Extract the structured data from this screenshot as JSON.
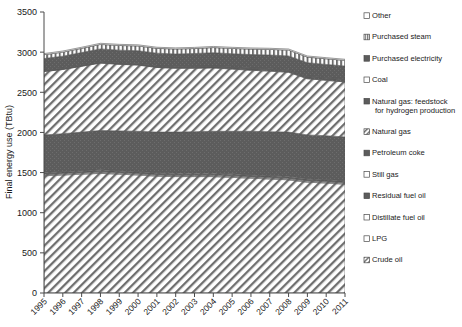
{
  "chart_data": {
    "type": "area",
    "title": "",
    "subtitle": "",
    "xlabel": "",
    "ylabel": "Final energy use (TBtu)",
    "xlim": [
      1995,
      2011
    ],
    "ylim": [
      0,
      3500
    ],
    "yticks": [
      0,
      500,
      1000,
      1500,
      2000,
      2500,
      3000,
      3500
    ],
    "grid": false,
    "stacked": true,
    "legend_position": "right",
    "categories": [
      "1995",
      "1996",
      "1997",
      "1998",
      "1999",
      "2000",
      "2001",
      "2002",
      "2003",
      "2004",
      "2005",
      "2006",
      "2007",
      "2008",
      "2009",
      "2010",
      "2011"
    ],
    "series": [
      {
        "name": "Crude oil",
        "pattern": "diagonal-hatch-light",
        "values": [
          1460,
          1470,
          1480,
          1490,
          1480,
          1470,
          1455,
          1450,
          1450,
          1450,
          1440,
          1430,
          1420,
          1410,
          1380,
          1370,
          1355
        ]
      },
      {
        "name": "LPG",
        "pattern": "diagonal-hatch-light",
        "values": [
          12,
          12,
          12,
          12,
          12,
          12,
          12,
          12,
          12,
          12,
          12,
          12,
          12,
          12,
          12,
          12,
          12
        ]
      },
      {
        "name": "Distillate fuel oil",
        "pattern": "diagonal-hatch-light",
        "values": [
          10,
          10,
          10,
          10,
          10,
          10,
          10,
          10,
          10,
          10,
          10,
          10,
          10,
          10,
          10,
          10,
          10
        ]
      },
      {
        "name": "Residual fuel oil",
        "pattern": "solid-dark",
        "values": [
          14,
          14,
          14,
          14,
          14,
          14,
          14,
          14,
          14,
          14,
          14,
          14,
          14,
          14,
          14,
          14,
          14
        ]
      },
      {
        "name": "Still gas",
        "pattern": "diagonal-hatch-light",
        "values": [
          8,
          8,
          8,
          8,
          8,
          8,
          8,
          8,
          8,
          8,
          8,
          8,
          8,
          8,
          8,
          8,
          8
        ]
      },
      {
        "name": "Petroleum coke",
        "pattern": "solid-dark",
        "values": [
          465,
          470,
          480,
          490,
          495,
          500,
          505,
          510,
          515,
          520,
          530,
          540,
          545,
          550,
          545,
          545,
          545
        ]
      },
      {
        "name": "Natural gas",
        "pattern": "diagonal-hatch-light",
        "values": [
          790,
          800,
          820,
          840,
          830,
          825,
          805,
          795,
          790,
          790,
          775,
          760,
          755,
          745,
          700,
          690,
          685
        ]
      },
      {
        "name": "Natural gas: feedstock for hydrogen production",
        "pattern": "solid-dark",
        "values": [
          6,
          6,
          6,
          6,
          6,
          6,
          8,
          10,
          12,
          14,
          16,
          18,
          20,
          22,
          24,
          26,
          28
        ]
      },
      {
        "name": "Coal",
        "pattern": "solid-dark-thin",
        "values": [
          10,
          10,
          10,
          10,
          10,
          10,
          10,
          10,
          10,
          10,
          10,
          10,
          10,
          10,
          10,
          10,
          10
        ]
      },
      {
        "name": "Purchased electricity",
        "pattern": "solid-dark",
        "values": [
          145,
          150,
          155,
          160,
          160,
          162,
          160,
          158,
          162,
          165,
          165,
          168,
          170,
          172,
          165,
          162,
          160
        ]
      },
      {
        "name": "Purchased steam",
        "pattern": "vertical-stripes",
        "values": [
          48,
          50,
          52,
          56,
          58,
          60,
          60,
          62,
          62,
          64,
          66,
          68,
          70,
          72,
          70,
          70,
          70
        ]
      },
      {
        "name": "Other",
        "pattern": "white-outline",
        "values": [
          14,
          14,
          14,
          14,
          14,
          14,
          14,
          14,
          14,
          14,
          14,
          14,
          14,
          14,
          14,
          14,
          14
        ]
      }
    ],
    "totals": [
      2982,
      3004,
      3041,
      3090,
      3087,
      3091,
      3061,
      3053,
      3059,
      3071,
      3062,
      3048,
      3044,
      3041,
      2952,
      2931,
      2911
    ]
  },
  "legend": {
    "items": [
      {
        "label": "Other",
        "pattern": "white-outline"
      },
      {
        "label": "Purchased steam",
        "pattern": "vertical-stripes"
      },
      {
        "label": "Purchased electricity",
        "pattern": "solid-dark"
      },
      {
        "label": "Coal",
        "pattern": "white-outline"
      },
      {
        "label": "Natural gas: feedstock",
        "label2": "for hydrogen production",
        "pattern": "solid-dark"
      },
      {
        "label": "Natural gas",
        "pattern": "diagonal-hatch-light"
      },
      {
        "label": "Petroleum coke",
        "pattern": "solid-dark"
      },
      {
        "label": "Still gas",
        "pattern": "white-outline"
      },
      {
        "label": "Residual fuel oil",
        "pattern": "solid-dark"
      },
      {
        "label": "Distillate fuel oil",
        "pattern": "white-outline"
      },
      {
        "label": "LPG",
        "pattern": "white-outline"
      },
      {
        "label": "Crude oil",
        "pattern": "diagonal-hatch-light"
      }
    ]
  },
  "colors": {
    "dark_fill": "#585858",
    "light_fill": "#f2f2f2",
    "hatch_stroke": "#6b6b6b",
    "axis": "#4a4a4a",
    "text": "#1a1a1a",
    "background": "#ffffff"
  }
}
